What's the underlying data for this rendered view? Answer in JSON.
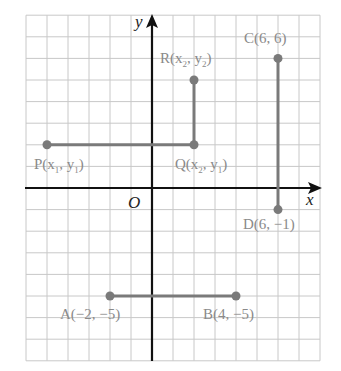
{
  "figure": {
    "grid": {
      "x_min": -6,
      "x_max": 8,
      "y_min": -8,
      "y_max": 8
    },
    "axes": {
      "x_label": "x",
      "y_label": "y",
      "origin_label": "O"
    },
    "colors": {
      "grid": "#c8c8c8",
      "axis": "#111111",
      "segment": "#7a7a7a",
      "label": "#8a8a8a"
    },
    "points": [
      {
        "id": "P",
        "name": "P",
        "x": -5,
        "y": 2,
        "coord_text": "(x1, y1)"
      },
      {
        "id": "Q",
        "name": "Q",
        "x": 2,
        "y": 2,
        "coord_text": "(x2, y1)"
      },
      {
        "id": "R",
        "name": "R",
        "x": 2,
        "y": 5,
        "coord_text": "(x2, y2)"
      },
      {
        "id": "C",
        "name": "C",
        "x": 6,
        "y": 6,
        "coord_text": "(6, 6)"
      },
      {
        "id": "D",
        "name": "D",
        "x": 6,
        "y": -1,
        "coord_text": "(6, −1)"
      },
      {
        "id": "A",
        "name": "A",
        "x": -2,
        "y": -5,
        "coord_text": "(−2, −5)"
      },
      {
        "id": "B",
        "name": "B",
        "x": 4,
        "y": -5,
        "coord_text": "(4, −5)"
      }
    ],
    "segments": [
      {
        "from": "P",
        "to": "Q"
      },
      {
        "from": "Q",
        "to": "R"
      },
      {
        "from": "C",
        "to": "D"
      },
      {
        "from": "A",
        "to": "B"
      }
    ],
    "labels": {
      "P": "P(x",
      "P_sub1": "1",
      "P_mid": ", y",
      "P_sub2": "1",
      "P_end": ")",
      "Q": "Q(x",
      "Q_sub1": "2",
      "Q_mid": ", y",
      "Q_sub2": "1",
      "Q_end": ")",
      "R": "R(x",
      "R_sub1": "2",
      "R_mid": ", y",
      "R_sub2": "2",
      "R_end": ")",
      "C": "C(6, 6)",
      "D": "D(6, −1)",
      "A": "A(−2, −5)",
      "B": "B(4, −5)"
    }
  }
}
